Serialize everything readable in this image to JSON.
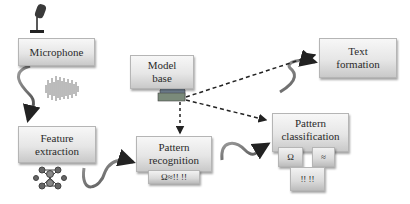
{
  "diagram": {
    "type": "speech-recognition-pipeline",
    "nodes": [
      {
        "id": "microphone",
        "label": "Microphone"
      },
      {
        "id": "feature_extraction",
        "label": "Feature extraction",
        "lines": [
          "Feature",
          "extraction"
        ]
      },
      {
        "id": "model_base",
        "label": "Model base",
        "lines": [
          "Model",
          "base"
        ]
      },
      {
        "id": "pattern_recognition",
        "label": "Pattern recognition",
        "lines": [
          "Pattern",
          "recognition"
        ],
        "sub": "Ω≈!! !!"
      },
      {
        "id": "text_formation",
        "label": "Text formation",
        "lines": [
          "Text",
          "formation"
        ]
      },
      {
        "id": "pattern_classification",
        "label": "Pattern classification",
        "lines": [
          "Pattern",
          "classification"
        ],
        "subs": [
          "Ω",
          "≈",
          "!! !!"
        ]
      }
    ],
    "edges": [
      {
        "from": "microphone",
        "to": "feature_extraction",
        "style": "curved-arrow"
      },
      {
        "from": "feature_extraction",
        "to": "pattern_recognition",
        "style": "curved-arrow"
      },
      {
        "from": "pattern_recognition",
        "to": "pattern_classification",
        "style": "curved-arrow"
      },
      {
        "from": "pattern_classification",
        "to": "text_formation",
        "style": "curved-arrow"
      },
      {
        "from": "model_base",
        "to": "pattern_recognition",
        "style": "dashed-arrow"
      },
      {
        "from": "model_base",
        "to": "pattern_classification",
        "style": "dashed-arrow"
      },
      {
        "from": "model_base",
        "to": "text_formation",
        "style": "dashed-arrow"
      }
    ],
    "icons": [
      "microphone-icon",
      "sound-wave-icon",
      "network-nodes-icon",
      "database-icon"
    ]
  }
}
